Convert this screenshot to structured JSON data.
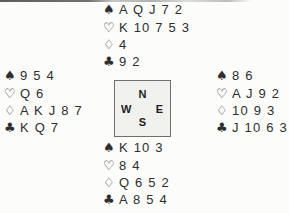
{
  "diagram": {
    "kind": "bridge-deal",
    "colors": {
      "page_background": "#fcfcfb",
      "text": "#2e2e2e",
      "compass_box_background": "#f1f1ee",
      "compass_box_border": "#6e6e6e"
    }
  },
  "suit_symbols": {
    "spade": "♠",
    "heart": "♡",
    "diamond": "♢",
    "club": "♣"
  },
  "compass": {
    "north": "N",
    "east": "E",
    "south": "S",
    "west": "W"
  },
  "hands": {
    "north": {
      "spades": "A Q J 7 2",
      "hearts": "K 10 7 5 3",
      "diamonds": "4",
      "clubs": "9 2"
    },
    "east": {
      "spades": "8 6",
      "hearts": "A J 9 2",
      "diamonds": "10 9 3",
      "clubs": "J 10 6 3"
    },
    "south": {
      "spades": "K 10 3",
      "hearts": "8 4",
      "diamonds": "Q 6 5 2",
      "clubs": "A 8 5 4"
    },
    "west": {
      "spades": "9 5 4",
      "hearts": "Q 6",
      "diamonds": "A K J 8 7",
      "clubs": "K Q 7"
    }
  }
}
